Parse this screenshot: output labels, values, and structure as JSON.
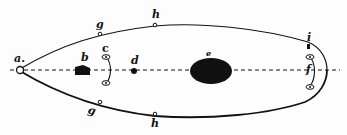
{
  "figure": {
    "type": "anatomical-outline",
    "colors": {
      "ink": "#111111",
      "background": "#fdfdfd"
    }
  },
  "labels": {
    "a": "a.",
    "b": "b",
    "c": "c",
    "d": "d",
    "e": "e",
    "f": "f",
    "g_top": "g",
    "g_bottom": "g",
    "h_top": "h",
    "h_bottom": "h",
    "i": "i"
  }
}
